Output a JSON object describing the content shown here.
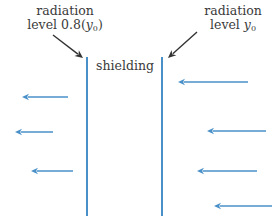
{
  "labels": {
    "left_line1": "radiation",
    "left_line2_prefix": "level 0.8(",
    "left_var": "y",
    "left_sub": "0",
    "left_suffix": ")",
    "right_line1": "radiation",
    "right_line2_prefix": "level ",
    "right_var": "y",
    "right_sub": "0",
    "shielding": "shielding"
  },
  "colors": {
    "wall": "#4a90c8",
    "radiation_arrow": "#4a90c8",
    "pointer": "#333333",
    "text": "#3a3a3a"
  },
  "walls": [
    {
      "name": "left-wall",
      "x": 87,
      "y1": 57,
      "y2": 216
    },
    {
      "name": "right-wall",
      "x": 162,
      "y1": 57,
      "y2": 216
    }
  ],
  "pointers": [
    {
      "name": "left-pointer",
      "from": [
        53,
        35
      ],
      "to": [
        83,
        58
      ]
    },
    {
      "name": "right-pointer",
      "from": [
        197,
        32
      ],
      "to": [
        168,
        58
      ]
    }
  ],
  "arrows_left_side": [
    {
      "y": 97,
      "x_start": 68,
      "x_end": 22
    },
    {
      "y": 132,
      "x_start": 53,
      "x_end": 15
    },
    {
      "y": 171,
      "x_start": 73,
      "x_end": 31
    }
  ],
  "arrows_right_side": [
    {
      "y": 82,
      "x_start": 248,
      "x_end": 178
    },
    {
      "y": 131,
      "x_start": 266,
      "x_end": 207
    },
    {
      "y": 171,
      "x_start": 257,
      "x_end": 197
    },
    {
      "y": 206,
      "x_start": 272,
      "x_end": 214
    }
  ]
}
